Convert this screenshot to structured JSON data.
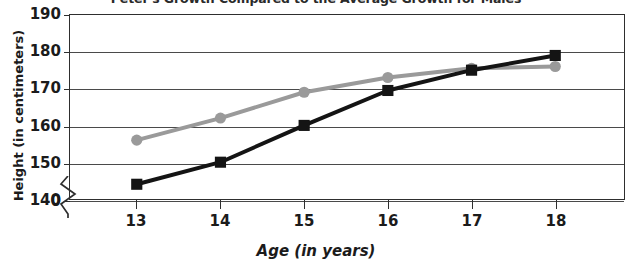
{
  "chart_data": {
    "type": "line",
    "title": "Peter's Growth Compared to the Average Growth for Males",
    "xlabel": "Age (in years)",
    "ylabel": "Height (in centimeters)",
    "x": [
      13,
      14,
      15,
      16,
      17,
      18
    ],
    "xtick_labels": [
      "13",
      "14",
      "15",
      "16",
      "17",
      "18"
    ],
    "ytick_labels": [
      "190",
      "180",
      "170",
      "160",
      "150",
      "140",
      "0"
    ],
    "ytick_values": [
      190,
      180,
      170,
      160,
      150,
      140,
      0
    ],
    "ylim": [
      140,
      190
    ],
    "y_axis_break": true,
    "grid": true,
    "legend": "none",
    "series": [
      {
        "name": "Average Growth for Males",
        "marker": "circle",
        "color": "#9a9a9a",
        "values": [
          156,
          162,
          169,
          173,
          175.5,
          176
        ]
      },
      {
        "name": "Peter's Growth",
        "marker": "square",
        "color": "#141414",
        "values": [
          144,
          150,
          160,
          169.5,
          175,
          179
        ]
      }
    ]
  },
  "axis": {
    "break_icon": "axis-break-zigzag"
  }
}
